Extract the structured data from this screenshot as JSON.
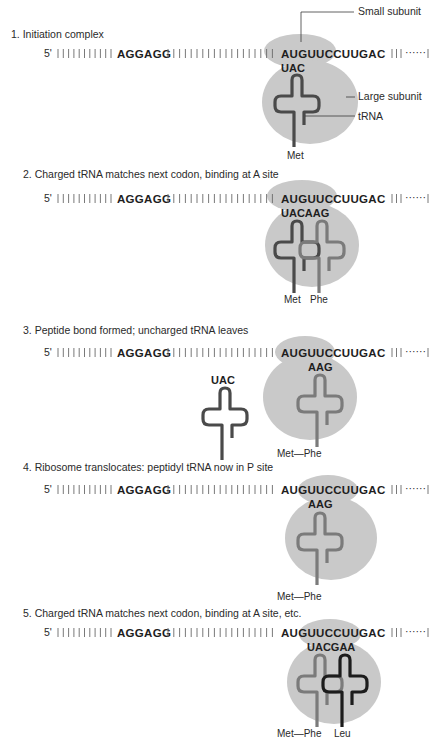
{
  "colors": {
    "ribosome": "#c9c9c9",
    "trna_met": "#4a4a4a",
    "trna_phe": "#7b7b7b",
    "trna_leu": "#1c1c1c",
    "text": "#2a2a2a"
  },
  "mrna": {
    "five_prime": "5'",
    "shine_dalgarno": "AGGAGG",
    "coding": "AUGUUCCUUGAC",
    "ticks_before": 11,
    "ticks_between": 19,
    "ticks_after": 3,
    "dotted_end": "······"
  },
  "labels": {
    "small_subunit": "Small subunit",
    "large_subunit": "Large subunit",
    "trna": "tRNA"
  },
  "steps": [
    {
      "title": "1. Initiation complex",
      "anticodon": "UAC",
      "amino_acids": "Met"
    },
    {
      "title": "2. Charged tRNA matches next codon, binding at A site",
      "anticodon": "UACAAG",
      "amino_acids_left": "Met",
      "amino_acids_right": "Phe"
    },
    {
      "title": "3. Peptide bond formed; uncharged tRNA leaves",
      "anticodon_released": "UAC",
      "anticodon": "AAG",
      "amino_acids": "Met—Phe"
    },
    {
      "title": "4. Ribosome translocates: peptidyl tRNA now in P site",
      "anticodon": "AAG",
      "amino_acids": "Met—Phe"
    },
    {
      "title": "5. Charged tRNA matches next codon, binding at A site, etc.",
      "anticodon": "UACGAA",
      "amino_acids_left": "Met—Phe",
      "amino_acids_right": "Leu"
    }
  ]
}
